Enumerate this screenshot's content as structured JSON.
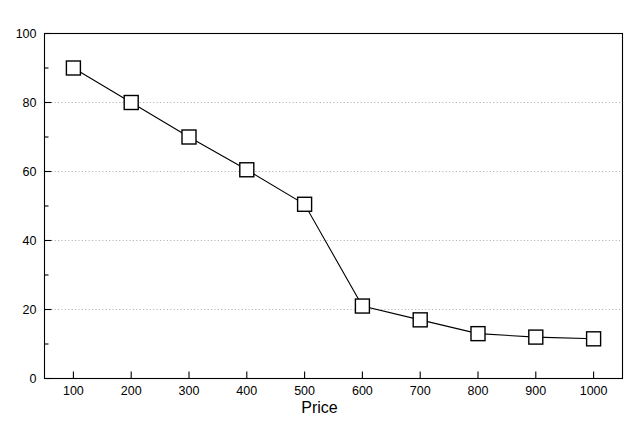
{
  "figure": {
    "title_remnant": "",
    "background_color": "#ffffff",
    "line_color": "#000000",
    "marker_face_color": "#ffffff",
    "marker_edge_color": "#000000",
    "grid_color": "#aaaaaa",
    "axis_color": "#000000"
  },
  "chart_data": {
    "type": "line",
    "title": "",
    "xlabel": "Price",
    "ylabel": "",
    "x": [
      100,
      200,
      300,
      400,
      500,
      600,
      700,
      800,
      900,
      1000
    ],
    "values": [
      90,
      80,
      70,
      60.5,
      50.5,
      21,
      17,
      13,
      12,
      11.5
    ],
    "series": [
      {
        "name": "",
        "x": [
          100,
          200,
          300,
          400,
          500,
          600,
          700,
          800,
          900,
          1000
        ],
        "values": [
          90,
          80,
          70,
          60.5,
          50.5,
          21,
          17,
          13,
          12,
          11.5
        ],
        "marker": "open-square",
        "line_style": "solid"
      }
    ],
    "xlim": [
      50,
      1050
    ],
    "ylim": [
      0,
      100
    ],
    "xticks": [
      100,
      200,
      300,
      400,
      500,
      600,
      700,
      800,
      900,
      1000
    ],
    "xtick_labels": [
      "100",
      "200",
      "300",
      "400",
      "500",
      "600",
      "700",
      "800",
      "900",
      "1000"
    ],
    "yticks": [
      0,
      20,
      40,
      60,
      80,
      100
    ],
    "ytick_labels": [
      "0",
      "20",
      "40",
      "60",
      "80",
      "100"
    ],
    "yminor_ticks": [
      10,
      30,
      50,
      70,
      90
    ],
    "grid": true,
    "grid_axis": "y",
    "grid_style": "dotted",
    "gridline_values": [
      20,
      40,
      60,
      80
    ],
    "legend": false,
    "legend_position": "none"
  }
}
